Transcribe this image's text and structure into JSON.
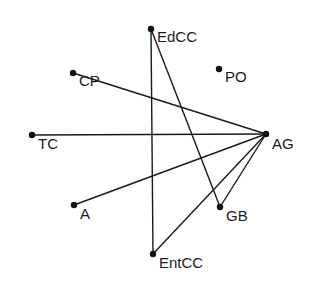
{
  "diagram": {
    "type": "network-graph",
    "nodes": [
      {
        "id": "EdCC",
        "label": "EdCC",
        "x": 151,
        "y": 29,
        "lx": 157,
        "ly": 42
      },
      {
        "id": "CP",
        "label": "CP",
        "x": 73,
        "y": 73,
        "lx": 79,
        "ly": 86
      },
      {
        "id": "PO",
        "label": "PO",
        "x": 219,
        "y": 69,
        "lx": 225,
        "ly": 82
      },
      {
        "id": "TC",
        "label": "TC",
        "x": 32,
        "y": 135,
        "lx": 38,
        "ly": 149
      },
      {
        "id": "AG",
        "label": "AG",
        "x": 266,
        "y": 134,
        "lx": 272,
        "ly": 149
      },
      {
        "id": "A",
        "label": "A",
        "x": 74,
        "y": 205,
        "lx": 80,
        "ly": 219
      },
      {
        "id": "GB",
        "label": "GB",
        "x": 220,
        "y": 207,
        "lx": 226,
        "ly": 221
      },
      {
        "id": "EntCC",
        "label": "EntCC",
        "x": 153,
        "y": 254,
        "lx": 159,
        "ly": 268
      }
    ],
    "edges": [
      {
        "from": "EdCC",
        "to": "EntCC"
      },
      {
        "from": "EdCC",
        "to": "GB"
      },
      {
        "from": "CP",
        "to": "AG"
      },
      {
        "from": "TC",
        "to": "AG"
      },
      {
        "from": "A",
        "to": "AG"
      },
      {
        "from": "GB",
        "to": "AG"
      },
      {
        "from": "EntCC",
        "to": "AG"
      }
    ],
    "colors": {
      "line": "#1a1a1a",
      "node": "#111111",
      "background": "#ffffff"
    }
  }
}
